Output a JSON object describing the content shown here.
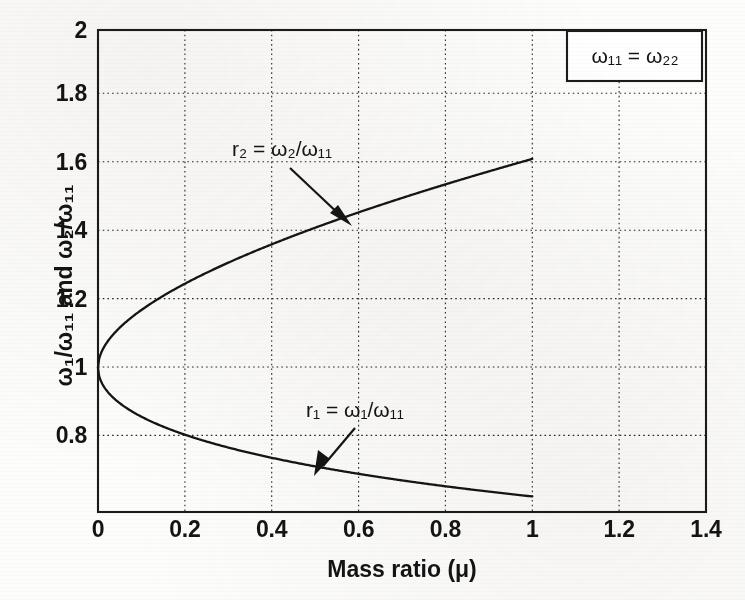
{
  "chart_data": {
    "type": "line",
    "title": "",
    "xlabel": "Mass ratio (μ)",
    "ylabel": "ω₁/ω₁₁ and ω₂/ω₁₁",
    "xlim": [
      0,
      1.4
    ],
    "ylim": [
      0.572,
      2.0
    ],
    "grid": true,
    "legend_position": "top-right",
    "xticks": [
      "0",
      "0.2",
      "0.4",
      "0.6",
      "0.8",
      "1",
      "1.2",
      "1.4"
    ],
    "xtick_values": [
      0,
      0.2,
      0.4,
      0.6,
      0.8,
      1.0,
      1.2,
      1.4
    ],
    "yticks": [
      "2",
      "1.8",
      "1.6",
      "1.4",
      "1.2",
      "1",
      "0.8"
    ],
    "ytick_values": [
      2.0,
      1.8,
      1.6,
      1.4,
      1.2,
      1.0,
      0.8
    ],
    "x": [
      0,
      0.05,
      0.1,
      0.15,
      0.2,
      0.25,
      0.3,
      0.35,
      0.4,
      0.45,
      0.5,
      0.55,
      0.6,
      0.65,
      0.7,
      0.75,
      0.8,
      0.85,
      0.9,
      0.95,
      1.0
    ],
    "series": [
      {
        "name": "r2 = ω₂/ω₁₁",
        "label": "r₂ = ω₂/ω₁₁",
        "values": [
          1.0,
          1.124,
          1.174,
          1.213,
          1.247,
          1.277,
          1.305,
          1.331,
          1.355,
          1.378,
          1.4,
          1.421,
          1.441,
          1.46,
          1.479,
          1.497,
          1.515,
          1.532,
          1.549,
          1.566,
          1.618
        ]
      },
      {
        "name": "r1 = ω₁/ω₁₁",
        "label": "r₁ = ω₁/ω₁₁",
        "values": [
          1.0,
          0.89,
          0.852,
          0.824,
          0.802,
          0.783,
          0.766,
          0.751,
          0.738,
          0.726,
          0.714,
          0.704,
          0.694,
          0.685,
          0.676,
          0.668,
          0.66,
          0.653,
          0.646,
          0.639,
          0.618
        ]
      }
    ],
    "annotations": [
      {
        "text": "r₂ = ω₂/ω₁₁",
        "points_to_series": "r2",
        "point_x": 0.52,
        "point_y": 1.41
      },
      {
        "text": "r₁ = ω₁/ω₁₁",
        "points_to_series": "r1",
        "point_x": 0.5,
        "point_y": 0.714
      }
    ],
    "legend_entries": [
      "ω₁₁ = ω₂₂"
    ]
  },
  "axes": {
    "x_title": "Mass ratio (μ)",
    "y_title": "ω₁/ω₁₁ and ω₂/ω₁₁",
    "x_tick_labels": [
      "0",
      "0.2",
      "0.4",
      "0.6",
      "0.8",
      "1",
      "1.2",
      "1.4"
    ],
    "y_tick_labels": [
      "2",
      "1.8",
      "1.6",
      "1.4",
      "1.2",
      "1",
      "0.8"
    ]
  },
  "legend": {
    "text": "ω₁₁ = ω₂₂"
  },
  "annotations": {
    "upper": "r₂ = ω₂/ω₁₁",
    "lower": "r₁ = ω₁/ω₁₁"
  },
  "colors": {
    "curve": "#151515",
    "grid": "#2a2a2a",
    "frame": "#1b1b1b",
    "text": "#141414",
    "background": "#fdfdfc"
  }
}
